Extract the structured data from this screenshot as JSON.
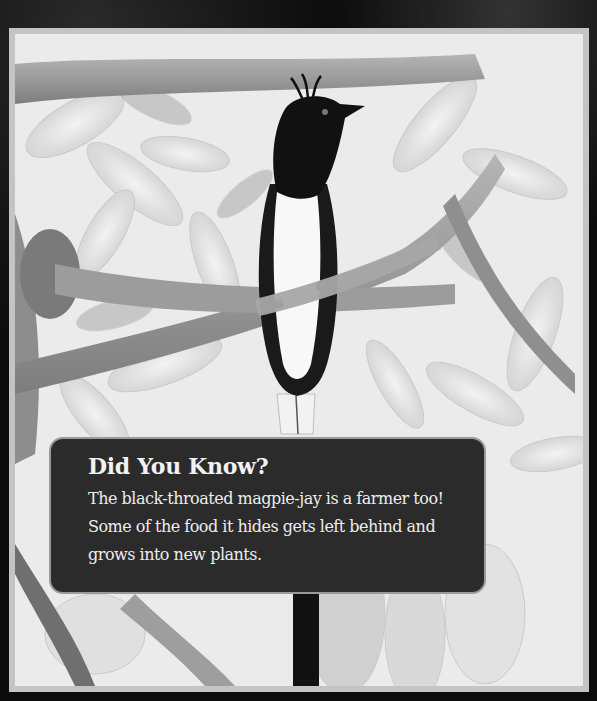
{
  "photo": {
    "subject": "black-throated magpie-jay perched on a branch",
    "style": "grayscale",
    "frame_color": "#c4c4c4",
    "background_color": "#0b0b0b"
  },
  "fact_box": {
    "title": "Did You Know?",
    "body": "The black-throated magpie-jay is a farmer too! Some of the food it hides gets left behind and grows into new plants.",
    "background_color": "#2b2b2b",
    "text_color": "#f2f2f2"
  }
}
